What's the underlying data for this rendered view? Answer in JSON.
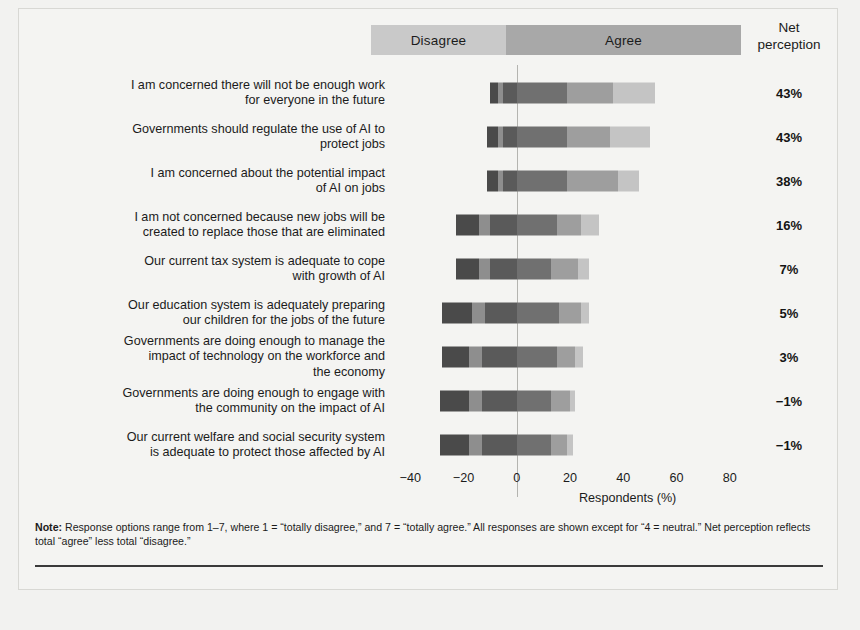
{
  "header": {
    "disagree_label": "Disagree",
    "agree_label": "Agree",
    "net_line1": "Net",
    "net_line2": "perception"
  },
  "axis": {
    "title": "Respondents (%)",
    "ticks": [
      "-40",
      "-20",
      "0",
      "20",
      "40",
      "60",
      "80"
    ],
    "tick_values": [
      -40,
      -20,
      0,
      20,
      40,
      60,
      80
    ],
    "min": -45,
    "max": 85
  },
  "note": {
    "prefix": "Note:",
    "text": " Response options range from 1–7, where 1 = “totally disagree,” and 7 = “totally agree.” All responses are shown except for “4 = neutral.” Net perception reflects total “agree” less total “disagree.”"
  },
  "colors": {
    "disagree_band": "#c9c9c9",
    "agree_band": "#a8a8a8",
    "disagree_3": "#4a4a4a",
    "disagree_2": "#8e8e8e",
    "disagree_1": "#5a5a5a",
    "agree_1": "#707070",
    "agree_2": "#9e9e9e",
    "agree_3": "#c4c4c4",
    "zero_line": "#b4b4b0",
    "page_background": "#f4f4f2"
  },
  "chart_data": {
    "type": "bar",
    "title": "",
    "xlabel": "Respondents (%)",
    "ylabel": "",
    "xlim": [
      -45,
      85
    ],
    "grid": false,
    "legend_position": "top",
    "stacked": true,
    "diverging": true,
    "categories": [
      "I am concerned there will not be enough work for everyone in the future",
      "Governments should regulate the use of AI to protect jobs",
      "I am concerned about the potential impact of AI on jobs",
      "I am not concerned because new jobs will be created to replace those that are eliminated",
      "Our current tax system is adequate to cope with growth of AI",
      "Our education system is adequately preparing our children for the jobs of the future",
      "Governments are doing enough to manage the impact of technology on the workforce and the economy",
      "Governments are doing enough to engage with the community on the impact of AI",
      "Our current welfare and social security system is adequate to protect those affected by AI"
    ],
    "category_lines": [
      [
        "I am concerned there will not be enough work",
        "for everyone in the future"
      ],
      [
        "Governments should regulate the use of AI to",
        "protect jobs"
      ],
      [
        "I am concerned about the potential impact",
        "of AI on jobs"
      ],
      [
        "I am not concerned because new jobs will be",
        "created to replace those that are eliminated"
      ],
      [
        "Our current tax system is adequate to cope",
        "with growth of AI"
      ],
      [
        "Our education system is adequately preparing",
        "our children for the jobs of the future"
      ],
      [
        "Governments are doing enough to manage the",
        "impact of technology on the workforce and",
        "the economy"
      ],
      [
        "Governments are doing enough to engage with",
        "the community on the impact of AI"
      ],
      [
        "Our current welfare and social security system",
        "is adequate to protect those affected by AI"
      ]
    ],
    "series": [
      {
        "name": "1 = totally disagree",
        "side": "disagree",
        "color": "#4a4a4a",
        "values": [
          -3,
          -4,
          -4,
          -9,
          -9,
          -11,
          -10,
          -11,
          -11
        ]
      },
      {
        "name": "2",
        "side": "disagree",
        "color": "#8e8e8e",
        "values": [
          -2,
          -2,
          -2,
          -4,
          -4,
          -5,
          -5,
          -5,
          -5
        ]
      },
      {
        "name": "3",
        "side": "disagree",
        "color": "#5a5a5a",
        "values": [
          -5,
          -5,
          -5,
          -10,
          -10,
          -12,
          -13,
          -13,
          -13
        ]
      },
      {
        "name": "5",
        "side": "agree",
        "color": "#707070",
        "values": [
          19,
          19,
          19,
          15,
          13,
          16,
          15,
          13,
          13
        ]
      },
      {
        "name": "6",
        "side": "agree",
        "color": "#9e9e9e",
        "values": [
          17,
          16,
          19,
          9,
          10,
          8,
          7,
          7,
          6
        ]
      },
      {
        "name": "7 = totally agree",
        "side": "agree",
        "color": "#c4c4c4",
        "values": [
          16,
          15,
          8,
          7,
          4,
          3,
          3,
          2,
          2
        ]
      }
    ],
    "net_perception_label": "Net perception",
    "net_perception": [
      "43%",
      "43%",
      "38%",
      "16%",
      "7%",
      "5%",
      "3%",
      "−1%",
      "−1%"
    ],
    "net_perception_values": [
      43,
      43,
      38,
      16,
      7,
      5,
      3,
      -1,
      -1
    ]
  }
}
